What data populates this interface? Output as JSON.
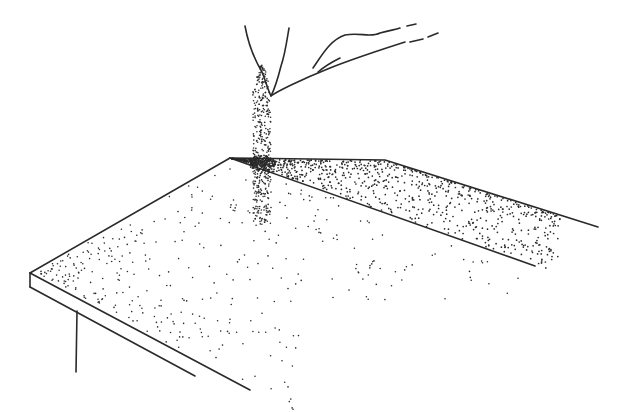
{
  "image": {
    "description": "Line drawing of a hand pouring sand onto a table top; sand falls in a stream and scatters across the surface and into a raised ridge.",
    "colors": {
      "ink": "#2a2a2a",
      "background": "#ffffff"
    }
  },
  "drawing": {
    "hand_outline": "M245,26 C249,48 256,62 262,72 C266,82 268,90 271,96 C276,92 300,80 330,68 C350,60 380,50 405,42",
    "hand_thumb": "M289,28 C287,40 285,55 281,66 C279,74 276,86 271,96",
    "finger_1": "M313,68 C322,55 330,40 345,35 C360,32 370,38 380,33 C390,30 395,30 400,28",
    "finger_1_dash": "M407,26 L416,24",
    "finger_2": "M318,72 C325,66 332,62 340,58",
    "finger_2_dashes": [
      "M410,42 L423,39",
      "M428,37 L438,33"
    ],
    "table_top": "M230,158 L385,160 L598,227",
    "table_ridge_line": "M230,158 L535,266",
    "table_front_edge": "M30,273 L230,158",
    "table_corner": "M30,273 L30,287",
    "table_side_lower": "M30,287 L195,376",
    "table_side_upper": "M30,273 L250,390",
    "table_leg": "M77,311 L76,372"
  },
  "sand": {
    "stream": {
      "x_center": 262,
      "y_top": 65,
      "y_bottom": 225,
      "half_width": 9,
      "count": 420
    },
    "heap_spot": {
      "x": 262,
      "y": 163,
      "rx": 14,
      "ry": 8,
      "count": 140
    },
    "ridge": {
      "count": 900
    },
    "surface": {
      "count": 520
    }
  }
}
